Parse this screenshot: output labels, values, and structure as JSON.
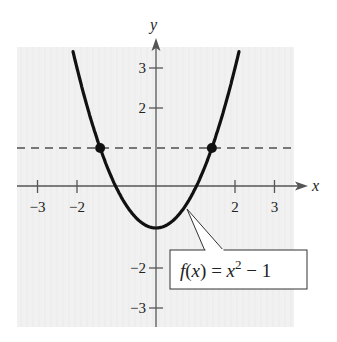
{
  "chart_data": {
    "type": "line",
    "title": "",
    "xlabel": "x",
    "ylabel": "y",
    "xlim": [
      -3.5,
      3.5
    ],
    "ylim": [
      -3.5,
      3.5
    ],
    "grid": true,
    "x_ticks": [
      -3,
      -2,
      2,
      3
    ],
    "y_ticks": [
      3,
      2,
      -2,
      -3
    ],
    "x_tick_labels": [
      "−3",
      "−2",
      "2",
      "3"
    ],
    "y_tick_labels": [
      "3",
      "2",
      "−2",
      "−3"
    ],
    "series": [
      {
        "name": "f(x) = x^2 - 1",
        "style": "solid",
        "color": "#111111",
        "function": "x^2 - 1",
        "x": [
          -2.2,
          -2,
          -1.5,
          -1,
          -0.5,
          0,
          0.5,
          1,
          1.5,
          2,
          2.2
        ],
        "y": [
          3.84,
          3,
          1.25,
          0,
          -0.75,
          -1,
          -0.75,
          0,
          1.25,
          3,
          3.84
        ]
      },
      {
        "name": "y = 1",
        "style": "dashed",
        "color": "#777777",
        "x": [
          -3.5,
          3.5
        ],
        "y": [
          1,
          1
        ]
      }
    ],
    "points": [
      {
        "x": -1.414,
        "y": 1,
        "label": "intersection"
      },
      {
        "x": 1.414,
        "y": 1,
        "label": "intersection"
      }
    ],
    "annotations": [
      {
        "text": "f(x) = x² − 1",
        "target": {
          "x": 0.8,
          "y": -0.36
        }
      }
    ]
  },
  "labels": {
    "x_axis": "x",
    "y_axis": "y",
    "function_f": "f",
    "function_paren_open": "(",
    "function_var": "x",
    "function_paren_close": ")",
    "function_eq": " = ",
    "function_base": "x",
    "function_exp": "2",
    "function_tail": " − 1"
  },
  "colors": {
    "background": "#ffffff",
    "panel": "#f1f1f1",
    "grid": "#e2e2e2",
    "axis": "#555555",
    "curve": "#111111",
    "dashed": "#777777"
  }
}
